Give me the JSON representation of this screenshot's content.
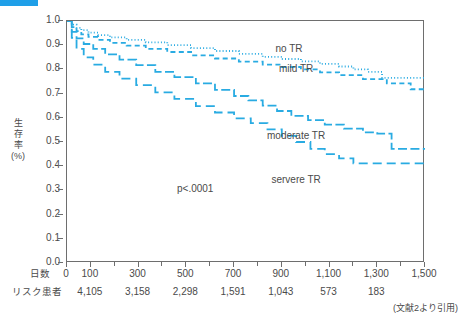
{
  "figure": {
    "accent_bar_color": "#1f9fe8",
    "title": "",
    "citation": "(文献2より引用)",
    "line_color": "#29abe2",
    "axis_color": "#6e6e6e"
  },
  "annotations": {
    "pvalue": "p<.0001"
  },
  "axes": {
    "y_title_lines": [
      "生",
      "存",
      "率",
      "(%)"
    ],
    "x_title": "日数",
    "risk_title": "リスク患者"
  },
  "chart_data": {
    "type": "line",
    "title": "",
    "xlabel": "日数",
    "ylabel": "生存率 (%)",
    "xlim": [
      0,
      1500
    ],
    "ylim": [
      0.0,
      1.0
    ],
    "grid": false,
    "legend_position": "inline-right",
    "x_ticks": [
      0,
      100,
      300,
      500,
      700,
      900,
      1100,
      1300,
      1500
    ],
    "x_tick_labels": [
      "0",
      "100",
      "300",
      "500",
      "700",
      "900",
      "1,100",
      "1,300",
      "1,500"
    ],
    "x_minor_ticks": [
      200,
      400,
      600,
      800,
      1000,
      1200,
      1400
    ],
    "y_ticks": [
      0.0,
      0.1,
      0.2,
      0.3,
      0.4,
      0.5,
      0.6,
      0.7,
      0.8,
      0.9,
      1.0
    ],
    "y_tick_labels": [
      "0.0",
      "0.1",
      "0.2",
      "0.3",
      "0.4",
      "0.5",
      "0.6",
      "0.7",
      "0.8",
      "0.9",
      "1.0"
    ],
    "at_risk": {
      "label": "リスク患者",
      "x": [
        100,
        300,
        500,
        700,
        900,
        1100,
        1300
      ],
      "values": [
        "4,105",
        "3,158",
        "2,298",
        "1,591",
        "1,043",
        "573",
        "183"
      ]
    },
    "series": [
      {
        "name": "no TR",
        "style": "dotted",
        "label_x": 930,
        "label_y": 0.885,
        "x": [
          0,
          20,
          40,
          60,
          90,
          130,
          180,
          250,
          330,
          420,
          520,
          620,
          720,
          820,
          900,
          980,
          1060,
          1140,
          1200,
          1260,
          1320,
          1500
        ],
        "values": [
          1.0,
          0.985,
          0.972,
          0.962,
          0.952,
          0.942,
          0.932,
          0.922,
          0.912,
          0.9,
          0.888,
          0.876,
          0.864,
          0.852,
          0.843,
          0.833,
          0.823,
          0.812,
          0.8,
          0.79,
          0.765,
          0.762
        ]
      },
      {
        "name": "mild TR",
        "style": "dashed",
        "label_x": 960,
        "label_y": 0.8,
        "x": [
          0,
          20,
          40,
          60,
          90,
          130,
          180,
          250,
          330,
          420,
          520,
          620,
          720,
          820,
          900,
          980,
          1060,
          1140,
          1240,
          1340,
          1440,
          1500
        ],
        "values": [
          1.0,
          0.975,
          0.958,
          0.945,
          0.934,
          0.922,
          0.91,
          0.898,
          0.885,
          0.872,
          0.858,
          0.845,
          0.832,
          0.82,
          0.81,
          0.8,
          0.788,
          0.776,
          0.76,
          0.742,
          0.718,
          0.712
        ]
      },
      {
        "name": "moderate TR",
        "style": "dashdot",
        "label_x": 960,
        "label_y": 0.525,
        "x": [
          0,
          20,
          40,
          70,
          110,
          160,
          220,
          290,
          370,
          450,
          540,
          620,
          700,
          760,
          820,
          880,
          940,
          1010,
          1080,
          1160,
          1240,
          1300,
          1360,
          1500
        ],
        "values": [
          1.0,
          0.955,
          0.928,
          0.905,
          0.885,
          0.862,
          0.84,
          0.818,
          0.79,
          0.768,
          0.742,
          0.715,
          0.69,
          0.672,
          0.65,
          0.628,
          0.608,
          0.59,
          0.572,
          0.555,
          0.54,
          0.535,
          0.472,
          0.468
        ]
      },
      {
        "name": "servere TR",
        "style": "dashed-long",
        "label_x": 960,
        "label_y": 0.345,
        "x": [
          0,
          20,
          40,
          70,
          110,
          160,
          220,
          290,
          370,
          450,
          540,
          620,
          700,
          770,
          840,
          900,
          960,
          1020,
          1080,
          1140,
          1200,
          1500
        ],
        "values": [
          1.0,
          0.93,
          0.885,
          0.85,
          0.82,
          0.79,
          0.762,
          0.735,
          0.705,
          0.678,
          0.648,
          0.622,
          0.598,
          0.578,
          0.552,
          0.525,
          0.5,
          0.472,
          0.45,
          0.432,
          0.412,
          0.408
        ]
      }
    ]
  }
}
